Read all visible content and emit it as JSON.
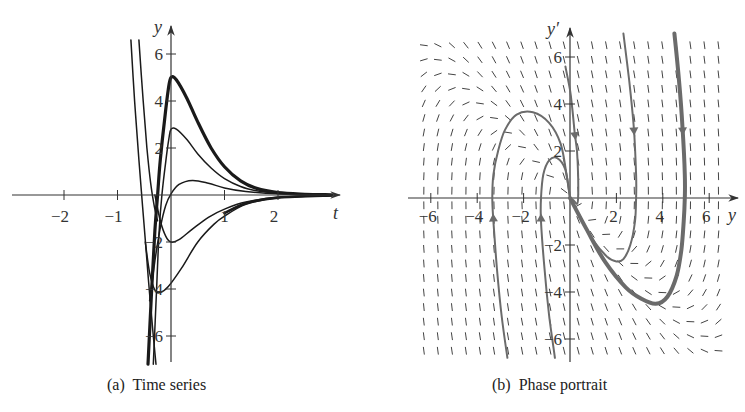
{
  "captions": {
    "a": "(a)  Time series",
    "b": "(b)  Phase portrait"
  },
  "colors": {
    "axis": "#333333",
    "time_series_curve": "#1a1a1a",
    "phase_curve": "#6b6b6b",
    "field": "#444444"
  },
  "chart_data": [
    {
      "id": "time-series",
      "type": "line",
      "title": "(a)  Time series",
      "xlabel": "t",
      "ylabel": "y",
      "xlim": [
        -3,
        3.2
      ],
      "ylim": [
        -7.3,
        6.9
      ],
      "xticks": [
        -2,
        -1,
        1,
        2
      ],
      "xtick_labels": [
        "−2",
        "−1",
        "1",
        "2"
      ],
      "yticks": [
        -6,
        -4,
        -2,
        2,
        4,
        6
      ],
      "ytick_labels": [
        "−6",
        "−4",
        "−2",
        "2",
        "4",
        "6"
      ],
      "grid": false,
      "legend": null,
      "series": [
        {
          "name": "thick-peak-5",
          "width": 3.2,
          "points": [
            [
              -0.43,
              -7.2
            ],
            [
              -0.36,
              -4
            ],
            [
              -0.3,
              -1.5
            ],
            [
              -0.25,
              0
            ],
            [
              -0.2,
              1.5
            ],
            [
              -0.12,
              3.2
            ],
            [
              -0.05,
              4.5
            ],
            [
              0,
              5
            ],
            [
              0.1,
              4.9
            ],
            [
              0.3,
              4.1
            ],
            [
              0.5,
              3.1
            ],
            [
              0.75,
              2
            ],
            [
              1,
              1.2
            ],
            [
              1.3,
              0.6
            ],
            [
              1.6,
              0.28
            ],
            [
              2,
              0.1
            ],
            [
              2.5,
              0.03
            ],
            [
              3,
              0.01
            ]
          ]
        },
        {
          "name": "peak-3",
          "width": 1.5,
          "points": [
            [
              -0.33,
              -7.2
            ],
            [
              -0.27,
              -4
            ],
            [
              -0.22,
              -1.5
            ],
            [
              -0.17,
              0
            ],
            [
              -0.1,
              1.4
            ],
            [
              -0.04,
              2.4
            ],
            [
              0,
              2.8
            ],
            [
              0.1,
              2.8
            ],
            [
              0.3,
              2.35
            ],
            [
              0.5,
              1.75
            ],
            [
              0.75,
              1.15
            ],
            [
              1,
              0.7
            ],
            [
              1.3,
              0.36
            ],
            [
              1.6,
              0.18
            ],
            [
              2,
              0.07
            ],
            [
              2.5,
              0.02
            ],
            [
              3,
              0.01
            ]
          ]
        },
        {
          "name": "steep-left-1",
          "width": 1.5,
          "points": [
            [
              -0.75,
              6.6
            ],
            [
              -0.68,
              4
            ],
            [
              -0.6,
              1.5
            ],
            [
              -0.53,
              -0.5
            ],
            [
              -0.46,
              -2.5
            ],
            [
              -0.4,
              -4.2
            ],
            [
              -0.33,
              -6
            ],
            [
              -0.28,
              -7.2
            ]
          ]
        },
        {
          "name": "steep-left-2",
          "width": 1.5,
          "points": [
            [
              -0.6,
              6.6
            ],
            [
              -0.52,
              4
            ],
            [
              -0.45,
              2
            ],
            [
              -0.38,
              0.5
            ],
            [
              -0.31,
              -0.5
            ],
            [
              -0.25,
              -1.1
            ]
          ]
        },
        {
          "name": "small-positive",
          "width": 1.5,
          "points": [
            [
              -0.4,
              -4.5
            ],
            [
              -0.3,
              -2.8
            ],
            [
              -0.2,
              -1.4
            ],
            [
              -0.1,
              -0.45
            ],
            [
              0,
              0.05
            ],
            [
              0.15,
              0.45
            ],
            [
              0.4,
              0.62
            ],
            [
              0.7,
              0.5
            ],
            [
              1,
              0.3
            ],
            [
              1.4,
              0.15
            ],
            [
              2,
              0.05
            ],
            [
              3,
              0.01
            ]
          ]
        },
        {
          "name": "trough-minus-2",
          "width": 1.5,
          "points": [
            [
              -0.3,
              0
            ],
            [
              -0.2,
              -1.1
            ],
            [
              -0.1,
              -1.75
            ],
            [
              0,
              -2
            ],
            [
              0.15,
              -1.9
            ],
            [
              0.4,
              -1.45
            ],
            [
              0.7,
              -0.95
            ],
            [
              1,
              -0.6
            ],
            [
              1.4,
              -0.3
            ],
            [
              2,
              -0.1
            ],
            [
              3,
              -0.01
            ]
          ]
        },
        {
          "name": "trough-minus-4",
          "width": 1.5,
          "points": [
            [
              -0.48,
              -2
            ],
            [
              -0.4,
              -3.3
            ],
            [
              -0.3,
              -4.05
            ],
            [
              -0.2,
              -4.15
            ],
            [
              -0.05,
              -3.9
            ],
            [
              0.2,
              -3.1
            ],
            [
              0.5,
              -2
            ],
            [
              0.8,
              -1.25
            ],
            [
              1,
              -0.9
            ],
            [
              1.4,
              -0.4
            ],
            [
              2,
              -0.12
            ],
            [
              3,
              -0.02
            ]
          ]
        },
        {
          "name": "trough-thick-2",
          "width": 2.6,
          "points": [
            [
              1,
              -0.78
            ],
            [
              1.4,
              -0.35
            ],
            [
              2,
              -0.11
            ],
            [
              3,
              -0.02
            ]
          ]
        }
      ]
    },
    {
      "id": "phase-portrait",
      "type": "line",
      "subtype": "phase-portrait-with-direction-field",
      "title": "(b)  Phase portrait",
      "xlabel": "y",
      "ylabel": "y′",
      "xlim": [
        -6.6,
        6.9
      ],
      "ylim": [
        -6.9,
        6.9
      ],
      "xticks": [
        -6,
        -4,
        -2,
        2,
        4,
        6
      ],
      "xtick_labels": [
        "−6",
        "−4",
        "−2",
        "2",
        "4",
        "6"
      ],
      "yticks": [
        -6,
        -4,
        -2,
        2,
        4,
        6
      ],
      "ytick_labels": [
        "−6",
        "−4",
        "−2",
        "2",
        "4",
        "6"
      ],
      "grid": false,
      "legend": null,
      "direction_field": {
        "x_range": [
          -6.3,
          6.4
        ],
        "y_range": [
          -6.5,
          6.5
        ],
        "nx": 22,
        "ny": 22,
        "segment_length": 7
      },
      "series": [
        {
          "name": "traj-start-neg3.5",
          "width": 2,
          "arrow_at": 3,
          "arrow_dir": "up",
          "points": [
            [
              -2.7,
              -6.8
            ],
            [
              -2.95,
              -5
            ],
            [
              -3.15,
              -3
            ],
            [
              -3.3,
              -1
            ],
            [
              -3.35,
              0
            ],
            [
              -3.3,
              1
            ],
            [
              -3.1,
              2
            ],
            [
              -2.8,
              2.9
            ],
            [
              -2.3,
              3.55
            ],
            [
              -1.6,
              3.65
            ],
            [
              -0.9,
              3.2
            ],
            [
              -0.4,
              2.3
            ],
            [
              -0.15,
              1
            ],
            [
              0,
              0
            ]
          ]
        },
        {
          "name": "traj-start-neg1.5",
          "width": 2,
          "arrow_at": 3,
          "arrow_dir": "up",
          "points": [
            [
              -0.65,
              -6.8
            ],
            [
              -0.9,
              -5
            ],
            [
              -1.1,
              -3
            ],
            [
              -1.25,
              -1
            ],
            [
              -1.25,
              0
            ],
            [
              -1.15,
              1
            ],
            [
              -0.9,
              1.6
            ],
            [
              -0.55,
              1.7
            ],
            [
              -0.2,
              1.2
            ],
            [
              0,
              0
            ]
          ]
        },
        {
          "name": "traj-from-top-0.5",
          "width": 2,
          "arrow_at": 3,
          "arrow_dir": "down",
          "points": [
            [
              -0.2,
              5.6
            ],
            [
              0,
              4.6
            ],
            [
              0.1,
              3.8
            ],
            [
              0.2,
              2.8
            ],
            [
              0.3,
              2
            ],
            [
              0.35,
              1
            ],
            [
              0.35,
              0
            ],
            [
              0.3,
              -0.25
            ],
            [
              0.15,
              -0.1
            ],
            [
              0,
              0
            ]
          ]
        },
        {
          "name": "traj-from-top-2.8",
          "width": 2,
          "arrow_at": 2,
          "arrow_dir": "down",
          "points": [
            [
              2.3,
              7
            ],
            [
              2.55,
              5
            ],
            [
              2.75,
              3
            ],
            [
              2.85,
              1
            ],
            [
              2.85,
              0
            ],
            [
              2.8,
              -1
            ],
            [
              2.6,
              -2
            ],
            [
              2.3,
              -2.6
            ],
            [
              2,
              -2.7
            ],
            [
              1.6,
              -2.5
            ],
            [
              1,
              -1.8
            ],
            [
              0.5,
              -0.9
            ],
            [
              0,
              0
            ]
          ]
        },
        {
          "name": "traj-from-top-4.9-thick",
          "width": 4,
          "arrow_at": 2,
          "arrow_dir": "down",
          "points": [
            [
              4.5,
              7
            ],
            [
              4.7,
              5
            ],
            [
              4.85,
              3
            ],
            [
              4.95,
              1
            ],
            [
              4.95,
              0
            ],
            [
              4.9,
              -1
            ],
            [
              4.8,
              -2.2
            ],
            [
              4.6,
              -3.3
            ],
            [
              4.2,
              -4.2
            ],
            [
              3.7,
              -4.5
            ],
            [
              3.1,
              -4.3
            ],
            [
              2.4,
              -3.8
            ],
            [
              1.5,
              -2.7
            ],
            [
              0.7,
              -1.3
            ],
            [
              0,
              0
            ]
          ]
        }
      ]
    }
  ]
}
